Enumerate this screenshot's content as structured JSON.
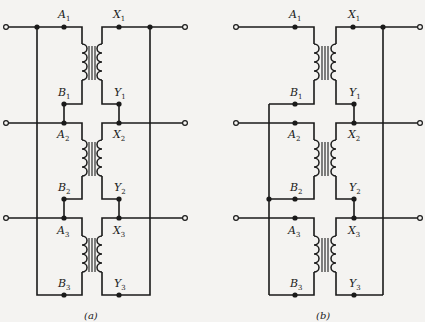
{
  "diagram": {
    "type": "three-phase transformer connection schematics",
    "panels": [
      {
        "id": "a",
        "caption": "(a)",
        "labels": {
          "A1": {
            "letter": "A",
            "sub": "1"
          },
          "B1": {
            "letter": "B",
            "sub": "1"
          },
          "X1": {
            "letter": "X",
            "sub": "1"
          },
          "Y1": {
            "letter": "Y",
            "sub": "1"
          },
          "A2": {
            "letter": "A",
            "sub": "2"
          },
          "B2": {
            "letter": "B",
            "sub": "2"
          },
          "X2": {
            "letter": "X",
            "sub": "2"
          },
          "Y2": {
            "letter": "Y",
            "sub": "2"
          },
          "A3": {
            "letter": "A",
            "sub": "3"
          },
          "B3": {
            "letter": "B",
            "sub": "3"
          },
          "X3": {
            "letter": "X",
            "sub": "3"
          },
          "Y3": {
            "letter": "Y",
            "sub": "3"
          }
        }
      },
      {
        "id": "b",
        "caption": "(b)",
        "labels": {
          "A1": {
            "letter": "A",
            "sub": "1"
          },
          "B1": {
            "letter": "B",
            "sub": "1"
          },
          "X1": {
            "letter": "X",
            "sub": "1"
          },
          "Y1": {
            "letter": "Y",
            "sub": "1"
          },
          "A2": {
            "letter": "A",
            "sub": "2"
          },
          "B2": {
            "letter": "B",
            "sub": "2"
          },
          "X2": {
            "letter": "X",
            "sub": "2"
          },
          "Y2": {
            "letter": "Y",
            "sub": "2"
          },
          "A3": {
            "letter": "A",
            "sub": "3"
          },
          "B3": {
            "letter": "B",
            "sub": "3"
          },
          "X3": {
            "letter": "X",
            "sub": "3"
          },
          "Y3": {
            "letter": "Y",
            "sub": "3"
          }
        }
      }
    ]
  }
}
